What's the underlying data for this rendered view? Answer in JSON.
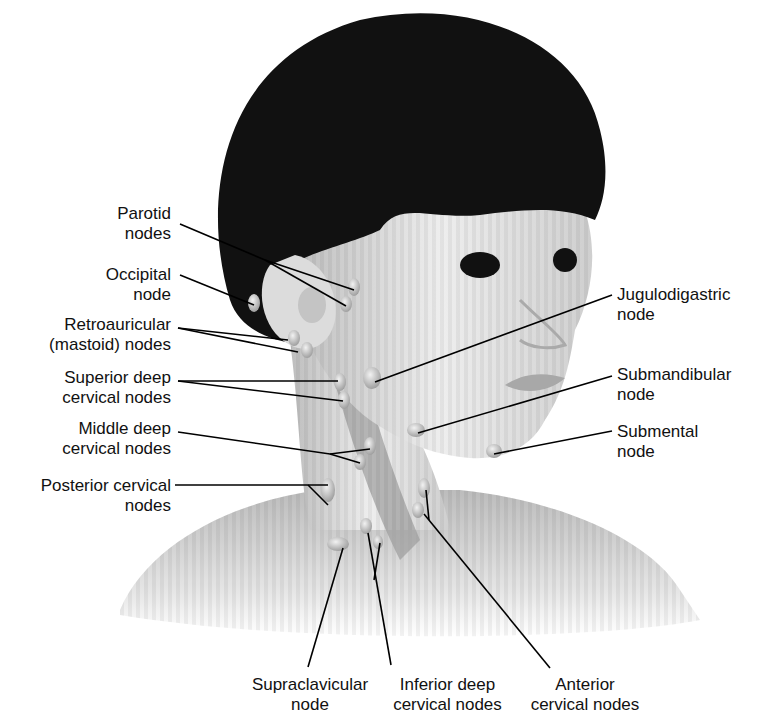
{
  "figure": {
    "colors": {
      "hair": "#111111",
      "skin": "#d9d9d9",
      "node": "#c8c8c8",
      "leader": "#000000"
    }
  },
  "labels": {
    "parotid": "Parotid\nnodes",
    "occipital": "Occipital\nnode",
    "retroauricular": "Retroauricular\n(mastoid) nodes",
    "superior_deep": "Superior deep\ncervical nodes",
    "middle_deep": "Middle deep\ncervical nodes",
    "posterior_cervical": "Posterior cervical\nnodes",
    "jugulodigastric": "Jugulodigastric\nnode",
    "submandibular": "Submandibular\nnode",
    "submental": "Submental\nnode",
    "supraclavicular": "Supraclavicular\nnode",
    "inferior_deep": "Inferior deep\ncervical nodes",
    "anterior_cervical": "Anterior\ncervical nodes"
  }
}
